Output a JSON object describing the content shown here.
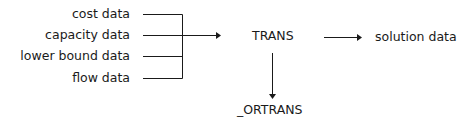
{
  "diagram": {
    "inputs": [
      {
        "label": "cost data"
      },
      {
        "label": "capacity data"
      },
      {
        "label": "lower bound data"
      },
      {
        "label": "flow data"
      }
    ],
    "process": {
      "label": "TRANS"
    },
    "output": {
      "label": "solution data"
    },
    "secondary_output": {
      "label": "_ORTRANS"
    },
    "colors": {
      "line": "#1a1a1a",
      "background": "#ffffff"
    }
  }
}
